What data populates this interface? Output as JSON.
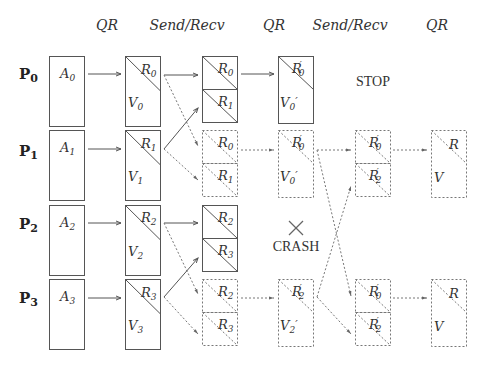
{
  "header": {
    "steps": [
      {
        "label": "QR",
        "x": 107
      },
      {
        "label": "Send/Recv",
        "x": 187
      },
      {
        "label": "QR",
        "x": 274
      },
      {
        "label": "Send/Recv",
        "x": 350
      },
      {
        "label": "QR",
        "x": 437
      }
    ]
  },
  "processes": [
    {
      "label": "P",
      "sub": "0",
      "y": 73
    },
    {
      "label": "P",
      "sub": "1",
      "y": 150
    },
    {
      "label": "P",
      "sub": "2",
      "y": 223
    },
    {
      "label": "P",
      "sub": "3",
      "y": 297
    }
  ],
  "annotations": {
    "stop": "STOP",
    "crash": "CRASH",
    "crash_mark": "×"
  },
  "columns": {
    "A": [
      {
        "name": "A",
        "sub": "0"
      },
      {
        "name": "A",
        "sub": "1"
      },
      {
        "name": "A",
        "sub": "2"
      },
      {
        "name": "A",
        "sub": "3"
      }
    ],
    "QR1": [
      {
        "r": "R",
        "rsub": "0",
        "v": "V",
        "vsub": "0"
      },
      {
        "r": "R",
        "rsub": "1",
        "v": "V",
        "vsub": "1"
      },
      {
        "r": "R",
        "rsub": "2",
        "v": "V",
        "vsub": "2"
      },
      {
        "r": "R",
        "rsub": "3",
        "v": "V",
        "vsub": "3"
      }
    ],
    "SR1": [
      {
        "top": "R0",
        "bottom": "R1",
        "style": "solid"
      },
      {
        "top": "R0",
        "bottom": "R1",
        "style": "dashed"
      },
      {
        "top": "R2",
        "bottom": "R3",
        "style": "solid"
      },
      {
        "top": "R2",
        "bottom": "R3",
        "style": "dashed"
      }
    ],
    "QR2": [
      {
        "r": "R'0",
        "v": "V0'",
        "style": "solid"
      },
      {
        "r": "R'0",
        "v": "V0'",
        "style": "dashed"
      },
      {
        "r": "R'2",
        "v": "V2'",
        "style": "dashed"
      }
    ],
    "SR2": [
      {
        "top": "R'0",
        "bottom": "R'2",
        "style": "dashed"
      },
      {
        "top": "R'0",
        "bottom": "R'2",
        "style": "dashed"
      }
    ],
    "QR3": [
      {
        "r": "R",
        "v": "V",
        "style": "dashed"
      },
      {
        "r": "R",
        "v": "V",
        "style": "dashed"
      }
    ]
  },
  "colors": {
    "stroke": "#555555",
    "dashed": "#777777",
    "text": "#333333"
  }
}
